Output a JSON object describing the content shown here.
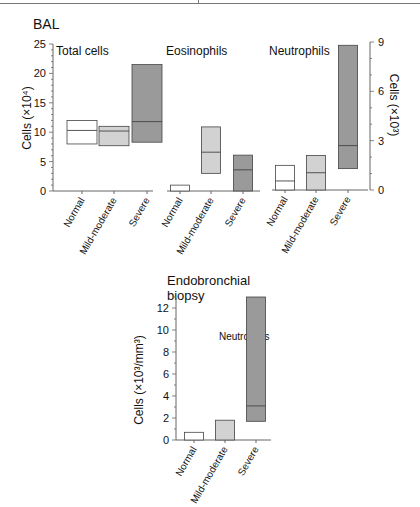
{
  "colors": {
    "normal": "#ffffff",
    "mild_moderate": "#d2d2d2",
    "severe": "#9a9a9a",
    "stroke": "#444444",
    "axis": "#666666"
  },
  "sections": {
    "bal_title": "BAL",
    "biopsy_title_line1": "Endobronchial",
    "biopsy_title_line2": "biopsy"
  },
  "chart_data": [
    {
      "type": "bar",
      "subtype": "floating-range-with-median",
      "title": "Total cells",
      "section": "BAL",
      "categories": [
        "Normal",
        "Mild-moderate",
        "Severe"
      ],
      "series": [
        {
          "name": "upper",
          "values": [
            12.0,
            11.0,
            21.5
          ]
        },
        {
          "name": "median",
          "values": [
            10.3,
            10.2,
            11.8
          ]
        },
        {
          "name": "lower",
          "values": [
            8.0,
            7.7,
            8.3
          ]
        }
      ],
      "ylabel": "Cells (×10⁴)",
      "ylim": [
        0,
        25
      ],
      "yticks": [
        0,
        5,
        10,
        15,
        20,
        25
      ],
      "axis": "left"
    },
    {
      "type": "bar",
      "subtype": "floating-range-with-median",
      "title": "Eosinophils",
      "section": "BAL",
      "categories": [
        "Normal",
        "Mild-moderate",
        "Severe"
      ],
      "series": [
        {
          "name": "upper",
          "values": [
            1.0,
            10.9,
            6.1
          ]
        },
        {
          "name": "median",
          "values": [
            null,
            6.6,
            3.6
          ]
        },
        {
          "name": "lower",
          "values": [
            0,
            3.0,
            0
          ]
        }
      ],
      "ylabel": "Cells (×10⁴)",
      "ylim": [
        0,
        25
      ],
      "axis": "shared-left"
    },
    {
      "type": "bar",
      "subtype": "floating-range-with-median",
      "title": "Neutrophils",
      "section": "BAL",
      "categories": [
        "Normal",
        "Mild-moderate",
        "Severe"
      ],
      "series": [
        {
          "name": "upper",
          "values": [
            1.5,
            2.1,
            8.8
          ]
        },
        {
          "name": "median",
          "values": [
            0.55,
            1.05,
            2.7
          ]
        },
        {
          "name": "lower",
          "values": [
            0,
            0,
            1.3
          ]
        }
      ],
      "ylabel": "Cells (×10³)",
      "ylim": [
        0,
        9
      ],
      "yticks": [
        0,
        3,
        6,
        9
      ],
      "axis": "right"
    },
    {
      "type": "bar",
      "subtype": "floating-range-with-median",
      "title": "Neutrophils",
      "section": "Endobronchial biopsy",
      "categories": [
        "Normal",
        "Mild-moderate",
        "Severe"
      ],
      "series": [
        {
          "name": "upper",
          "values": [
            0.7,
            1.8,
            13.0
          ]
        },
        {
          "name": "median",
          "values": [
            null,
            null,
            3.1
          ]
        },
        {
          "name": "lower",
          "values": [
            0,
            0,
            1.7
          ]
        }
      ],
      "ylabel": "Cells (×10³/mm³)",
      "ylim": [
        0,
        13
      ],
      "yticks": [
        0,
        2,
        4,
        6,
        8,
        10,
        12
      ],
      "axis": "left"
    }
  ],
  "labels": {
    "total_cells": "Total cells",
    "eosinophils": "Eosinophils",
    "neutrophils": "Neutrophils",
    "neutrophils_biopsy": "Neutrophils",
    "ylabel_left": "Cells (×10⁴)",
    "ylabel_right": "Cells (×10³)",
    "ylabel_biopsy": "Cells (×10³/mm³)",
    "cat_normal": "Normal",
    "cat_mild": "Mild-moderate",
    "cat_severe": "Severe"
  }
}
